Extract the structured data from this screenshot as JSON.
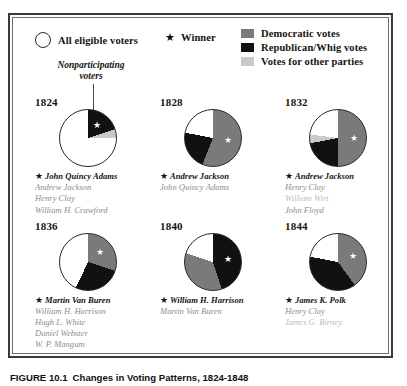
{
  "legend": {
    "eligible_label": "All eligible voters",
    "winner_label": "Winner",
    "winner_star": "★",
    "items": [
      {
        "label": "Democratic votes",
        "color": "#7a7a7a",
        "key": "democratic"
      },
      {
        "label": "Republican/Whig votes",
        "color": "#111111",
        "key": "whig"
      },
      {
        "label": "Votes for other parties",
        "color": "#c9c9c9",
        "key": "other"
      }
    ]
  },
  "callout": {
    "line1": "Nonparticipating",
    "line2": "voters"
  },
  "colors": {
    "democratic": "#7a7a7a",
    "whig": "#111111",
    "other": "#c9c9c9",
    "nonparticipating": "#ffffff",
    "outline": "#2a2a2a"
  },
  "chart_data": {
    "type": "pie",
    "title": "Changes in Voting Patterns, 1824-1848",
    "legend_position": "top",
    "series_labels": [
      "Democratic votes",
      "Republican/Whig votes",
      "Votes for other parties",
      "Nonparticipating voters"
    ],
    "charts": [
      {
        "year": "1824",
        "slices": [
          {
            "key": "whig",
            "value": 20,
            "color": "#111111"
          },
          {
            "key": "other",
            "value": 5,
            "color": "#c9c9c9"
          },
          {
            "key": "nonparticipating",
            "value": 75,
            "color": "#ffffff"
          }
        ],
        "star_slice": "whig",
        "candidates": [
          {
            "name": "John Quincy Adams",
            "winner": true,
            "faded": false
          },
          {
            "name": "Andrew Jackson",
            "winner": false,
            "faded": false
          },
          {
            "name": "Henry Clay",
            "winner": false,
            "faded": false
          },
          {
            "name": "William H. Crawford",
            "winner": false,
            "faded": false
          }
        ]
      },
      {
        "year": "1828",
        "slices": [
          {
            "key": "democratic",
            "value": 56,
            "color": "#7a7a7a"
          },
          {
            "key": "whig",
            "value": 22,
            "color": "#111111"
          },
          {
            "key": "nonparticipating",
            "value": 22,
            "color": "#ffffff"
          }
        ],
        "star_slice": "democratic",
        "candidates": [
          {
            "name": "Andrew Jackson",
            "winner": true,
            "faded": false
          },
          {
            "name": "John Quincy Adams",
            "winner": false,
            "faded": false
          }
        ]
      },
      {
        "year": "1832",
        "slices": [
          {
            "key": "democratic",
            "value": 50,
            "color": "#7a7a7a"
          },
          {
            "key": "whig",
            "value": 22,
            "color": "#111111"
          },
          {
            "key": "other",
            "value": 5,
            "color": "#c9c9c9"
          },
          {
            "key": "nonparticipating",
            "value": 23,
            "color": "#ffffff"
          }
        ],
        "star_slice": "democratic",
        "candidates": [
          {
            "name": "Andrew Jackson",
            "winner": true,
            "faded": false
          },
          {
            "name": "Henry Clay",
            "winner": false,
            "faded": false
          },
          {
            "name": "William Wirt",
            "winner": false,
            "faded": true
          },
          {
            "name": "John Floyd",
            "winner": false,
            "faded": false
          }
        ]
      },
      {
        "year": "1836",
        "slices": [
          {
            "key": "democratic",
            "value": 30,
            "color": "#7a7a7a"
          },
          {
            "key": "whig",
            "value": 27,
            "color": "#111111"
          },
          {
            "key": "nonparticipating",
            "value": 43,
            "color": "#ffffff"
          }
        ],
        "star_slice": "democratic",
        "candidates": [
          {
            "name": "Martin Van Buren",
            "winner": true,
            "faded": false
          },
          {
            "name": "William H. Harrison",
            "winner": false,
            "faded": false
          },
          {
            "name": "Hugh L. White",
            "winner": false,
            "faded": false
          },
          {
            "name": "Daniel Webster",
            "winner": false,
            "faded": false
          },
          {
            "name": "W. P. Mangum",
            "winner": false,
            "faded": false
          }
        ]
      },
      {
        "year": "1840",
        "slices": [
          {
            "key": "whig",
            "value": 45,
            "color": "#111111"
          },
          {
            "key": "democratic",
            "value": 35,
            "color": "#7a7a7a"
          },
          {
            "key": "nonparticipating",
            "value": 20,
            "color": "#ffffff"
          }
        ],
        "star_slice": "whig",
        "candidates": [
          {
            "name": "William H. Harrison",
            "winner": true,
            "faded": false
          },
          {
            "name": "Martin Van Buren",
            "winner": false,
            "faded": false
          }
        ]
      },
      {
        "year": "1844",
        "slices": [
          {
            "key": "democratic",
            "value": 40,
            "color": "#7a7a7a"
          },
          {
            "key": "whig",
            "value": 38,
            "color": "#111111"
          },
          {
            "key": "nonparticipating",
            "value": 22,
            "color": "#ffffff"
          }
        ],
        "star_slice": "democratic",
        "candidates": [
          {
            "name": "James K. Polk",
            "winner": true,
            "faded": false
          },
          {
            "name": "Henry Clay",
            "winner": false,
            "faded": false
          },
          {
            "name": "James G. Birney",
            "winner": false,
            "faded": true
          }
        ]
      }
    ]
  },
  "caption": {
    "number": "FIGURE 10.1",
    "text": "Changes in Voting Patterns, 1824-1848"
  }
}
